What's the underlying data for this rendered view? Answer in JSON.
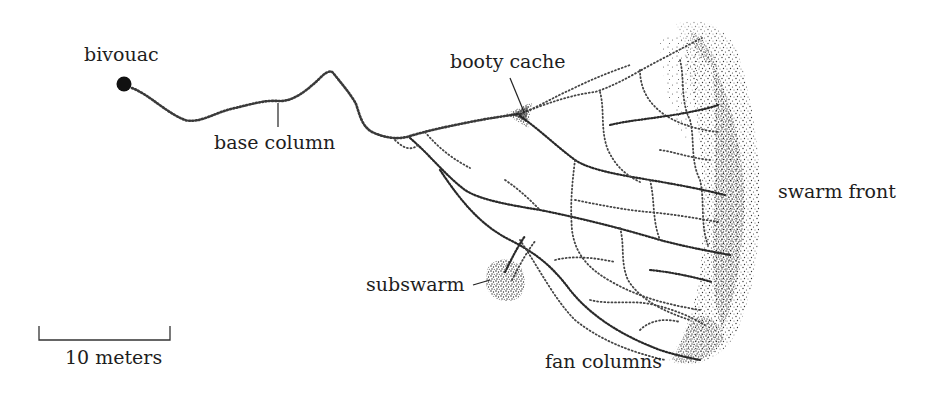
{
  "figure": {
    "labels": {
      "bivouac": "bivouac",
      "base_column": "base column",
      "booty_cache": "booty cache",
      "swarm_front": "swarm front",
      "subswarm": "subswarm",
      "fan_columns": "fan columns",
      "scale": "10 meters"
    },
    "scale_bar": {
      "length_label": "10 meters",
      "x_start": 38,
      "x_end": 170
    },
    "colors": {
      "ink": "#1e1e1e",
      "stipple": "#3a3a3a",
      "background": "#ffffff"
    }
  }
}
